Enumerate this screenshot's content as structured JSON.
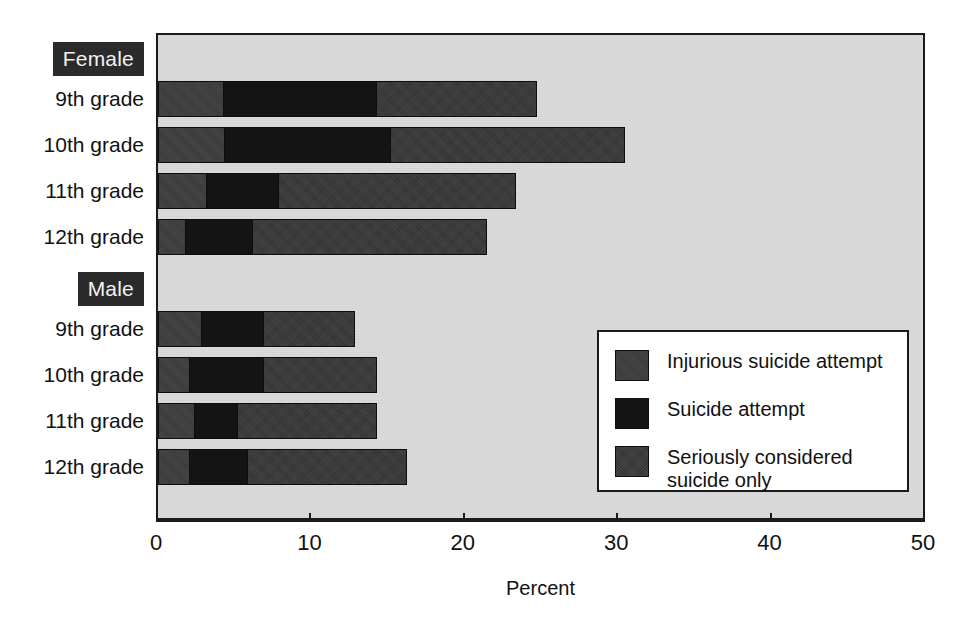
{
  "axis": {
    "title": "Percent",
    "ticks": [
      0,
      10,
      20,
      30,
      40,
      50
    ],
    "tick_labels": [
      "0",
      "10",
      "20",
      "30",
      "40",
      "50"
    ],
    "min": 0,
    "max": 50
  },
  "groups": [
    {
      "tag": "Female",
      "categories": [
        "9th grade",
        "10th grade",
        "11th grade",
        "12th grade"
      ]
    },
    {
      "tag": "Male",
      "categories": [
        "9th grade",
        "10th grade",
        "11th grade",
        "12th grade"
      ]
    }
  ],
  "legend": {
    "items": [
      {
        "label": "Injurious suicide attempt",
        "color": "#3b3b3b"
      },
      {
        "label": "Suicide attempt",
        "color": "#141414"
      },
      {
        "label": "Seriously considered\nsuicide only",
        "color": "#323232"
      }
    ]
  },
  "colors": {
    "plot_background": "#d9d9d9",
    "frame": "#1a1a1a",
    "tag_background": "#2b2b2b",
    "tag_text": "#f2f2f2",
    "series_1": "#3b3b3b",
    "series_2": "#141414",
    "series_3": "#323232"
  },
  "chart_data": {
    "type": "bar",
    "orientation": "horizontal",
    "stacked": true,
    "title": "",
    "subtitle": "",
    "xlabel": "Percent",
    "ylabel": "",
    "xlim": [
      0,
      50
    ],
    "grid": false,
    "legend_position": "inside-right",
    "categories": [
      "Female 9th grade",
      "Female 10th grade",
      "Female 11th grade",
      "Female 12th grade",
      "Male 9th grade",
      "Male 10th grade",
      "Male 11th grade",
      "Male 12th grade"
    ],
    "series": [
      {
        "name": "Injurious suicide attempt",
        "color": "#3b3b3b",
        "values": [
          4.3,
          4.4,
          3.2,
          1.8,
          2.9,
          2.1,
          2.4,
          2.1
        ]
      },
      {
        "name": "Suicide attempt",
        "color": "#141414",
        "values": [
          10.0,
          10.8,
          4.7,
          4.4,
          4.0,
          4.8,
          2.8,
          3.8
        ]
      },
      {
        "name": "Seriously considered suicide only",
        "color": "#323232",
        "values": [
          10.5,
          15.3,
          15.5,
          15.3,
          6.0,
          7.4,
          9.1,
          10.4
        ]
      }
    ],
    "totals": [
      24.8,
      30.5,
      23.4,
      21.5,
      12.9,
      14.3,
      14.3,
      16.3
    ],
    "annotations": []
  },
  "layout": {
    "bars": [
      {
        "group": 0,
        "index": 0,
        "top": 46,
        "segments": [
          4.3,
          10.0,
          10.5
        ]
      },
      {
        "group": 0,
        "index": 1,
        "top": 92,
        "segments": [
          4.4,
          10.8,
          15.3
        ]
      },
      {
        "group": 0,
        "index": 2,
        "top": 138,
        "segments": [
          3.2,
          4.7,
          15.5
        ]
      },
      {
        "group": 0,
        "index": 3,
        "top": 184,
        "segments": [
          1.8,
          4.4,
          15.3
        ]
      },
      {
        "group": 1,
        "index": 0,
        "top": 276,
        "segments": [
          2.9,
          4.0,
          6.0
        ]
      },
      {
        "group": 1,
        "index": 1,
        "top": 322,
        "segments": [
          2.1,
          4.8,
          7.4
        ]
      },
      {
        "group": 1,
        "index": 2,
        "top": 368,
        "segments": [
          2.4,
          2.8,
          9.1
        ]
      },
      {
        "group": 1,
        "index": 3,
        "top": 414,
        "segments": [
          2.1,
          3.8,
          10.4
        ]
      }
    ],
    "label_tops": {
      "female_tag": 42,
      "female_cats": [
        88,
        134,
        180,
        226
      ],
      "male_tag": 272,
      "male_cats": [
        318,
        364,
        410,
        456
      ]
    },
    "legend_rows": [
      18,
      66,
      114
    ]
  }
}
